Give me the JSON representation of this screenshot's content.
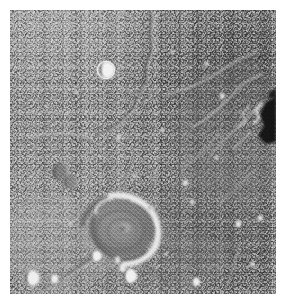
{
  "image": {
    "kind": "planetary-surface-photograph",
    "subject": "Martian volcanic plain with a central multi-ringed caldera / impact crater",
    "palette": {
      "margin": "#ffffff",
      "terrain_mid": "#8e8e8e",
      "terrain_light": "#d6d6d6",
      "terrain_bright": "#f0f0f0",
      "terrain_dark": "#4a4a4a",
      "shadow_black": "#161616"
    },
    "illumination": {
      "direction": "from the west (left)",
      "sun_azimuth_deg": 275,
      "shadow_side": "left"
    },
    "frame": {
      "width": 285,
      "height": 303,
      "margin_px": 10,
      "photo_width": 266,
      "photo_height": 284
    }
  },
  "features": {
    "central_caldera": {
      "name": "central multi-ringed caldera",
      "center_x": 112,
      "center_y": 218,
      "radius_x": 31,
      "radius_y": 26,
      "bright_rim_side": "east"
    },
    "sinuous_rille": {
      "name": "sinuous channel (rille)",
      "description": "narrow dark channel running north-south in the upper half"
    },
    "wrinkle_ridges": {
      "name": "wrinkle ridge system",
      "description": "low bright-crested ridges trending NE-SW in the east"
    },
    "shadow_scarp": {
      "name": "dark shadowed scarp",
      "description": "deep black shadow pocket on the eastern margin"
    },
    "craters": [
      {
        "id": "bright-crater-nw",
        "x": 96,
        "y": 60,
        "r": 9.5
      },
      {
        "id": "twin-crater-w",
        "x": 53,
        "y": 165,
        "r": 9
      },
      {
        "id": "crater-sw-a",
        "x": 24,
        "y": 272,
        "r": 8
      },
      {
        "id": "crater-sw-b",
        "x": 45,
        "y": 273,
        "r": 4.5
      },
      {
        "id": "crater-s-rim",
        "x": 90,
        "y": 253,
        "r": 5.5
      },
      {
        "id": "crater-s-pair",
        "x": 121,
        "y": 272,
        "r": 7
      },
      {
        "id": "crater-se",
        "x": 203,
        "y": 283,
        "r": 5
      },
      {
        "id": "crater-e-mid",
        "x": 186,
        "y": 184,
        "r": 3
      },
      {
        "id": "crater-ne",
        "x": 222,
        "y": 86,
        "r": 3
      }
    ]
  }
}
